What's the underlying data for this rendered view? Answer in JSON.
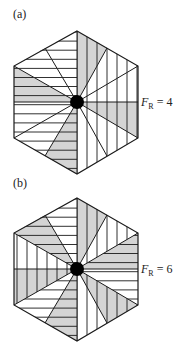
{
  "figure": {
    "width": 181,
    "height": 353,
    "colors": {
      "shade": "#d4d4d4",
      "line": "#1a1a1a",
      "background": "#ffffff",
      "dot": "#000000"
    },
    "panels": [
      {
        "id": "a",
        "label": "(a)",
        "label_pos": [
          13,
          18
        ],
        "fr_label_main": "F",
        "fr_label_sub": "R",
        "fr_label_value": " = 4",
        "fr_label_pos": [
          141,
          106
        ],
        "center": [
          77,
          102
        ],
        "sectors": [
          {
            "from": [
              77,
              31
            ],
            "to": [
              107,
              48
            ],
            "hatch": "vertical",
            "shaded": true
          },
          {
            "from": [
              107,
              48
            ],
            "to": [
              138,
              66
            ],
            "hatch": "vertical",
            "shaded": false
          },
          {
            "from": [
              138,
              66
            ],
            "to": [
              138,
              102
            ],
            "hatch": "vertical",
            "shaded": false
          },
          {
            "from": [
              138,
              102
            ],
            "to": [
              138,
              138
            ],
            "hatch": "vertical",
            "shaded": true
          },
          {
            "from": [
              138,
              138
            ],
            "to": [
              107,
              156
            ],
            "hatch": "vertical",
            "shaded": false
          },
          {
            "from": [
              107,
              156
            ],
            "to": [
              77,
              174
            ],
            "hatch": "vertical",
            "shaded": false
          },
          {
            "from": [
              77,
              174
            ],
            "to": [
              45,
              156
            ],
            "hatch": "horizontal",
            "shaded": true
          },
          {
            "from": [
              45,
              156
            ],
            "to": [
              14,
              138
            ],
            "hatch": "horizontal",
            "shaded": false
          },
          {
            "from": [
              14,
              138
            ],
            "to": [
              14,
              102
            ],
            "hatch": "horizontal",
            "shaded": false
          },
          {
            "from": [
              14,
              102
            ],
            "to": [
              14,
              66
            ],
            "hatch": "horizontal",
            "shaded": true
          },
          {
            "from": [
              14,
              66
            ],
            "to": [
              45,
              48
            ],
            "hatch": "horizontal",
            "shaded": false
          },
          {
            "from": [
              45,
              48
            ],
            "to": [
              77,
              31
            ],
            "hatch": "horizontal",
            "shaded": false
          }
        ]
      },
      {
        "id": "b",
        "label": "(b)",
        "label_pos": [
          13,
          187
        ],
        "fr_label_main": "F",
        "fr_label_sub": "R",
        "fr_label_value": " = 6",
        "fr_label_pos": [
          141,
          273
        ],
        "center": [
          77,
          269
        ],
        "sectors": [
          {
            "from": [
              77,
              198
            ],
            "to": [
              107,
              215
            ],
            "hatch": "vertical",
            "shaded": true
          },
          {
            "from": [
              107,
              215
            ],
            "to": [
              138,
              233
            ],
            "hatch": "vertical",
            "shaded": false
          },
          {
            "from": [
              138,
              233
            ],
            "to": [
              138,
              269
            ],
            "hatch": "horizontal",
            "shaded": true
          },
          {
            "from": [
              138,
              269
            ],
            "to": [
              138,
              305
            ],
            "hatch": "horizontal",
            "shaded": false
          },
          {
            "from": [
              138,
              305
            ],
            "to": [
              107,
              323
            ],
            "hatch": "vertical",
            "shaded": true
          },
          {
            "from": [
              107,
              323
            ],
            "to": [
              77,
              341
            ],
            "hatch": "vertical",
            "shaded": false
          },
          {
            "from": [
              77,
              341
            ],
            "to": [
              45,
              323
            ],
            "hatch": "horizontal",
            "shaded": true
          },
          {
            "from": [
              45,
              323
            ],
            "to": [
              14,
              305
            ],
            "hatch": "horizontal",
            "shaded": false
          },
          {
            "from": [
              14,
              305
            ],
            "to": [
              14,
              269
            ],
            "hatch": "vertical",
            "shaded": true
          },
          {
            "from": [
              14,
              269
            ],
            "to": [
              14,
              233
            ],
            "hatch": "vertical",
            "shaded": false
          },
          {
            "from": [
              14,
              233
            ],
            "to": [
              45,
              215
            ],
            "hatch": "horizontal",
            "shaded": true
          },
          {
            "from": [
              45,
              215
            ],
            "to": [
              77,
              198
            ],
            "hatch": "horizontal",
            "shaded": false
          }
        ]
      }
    ]
  }
}
